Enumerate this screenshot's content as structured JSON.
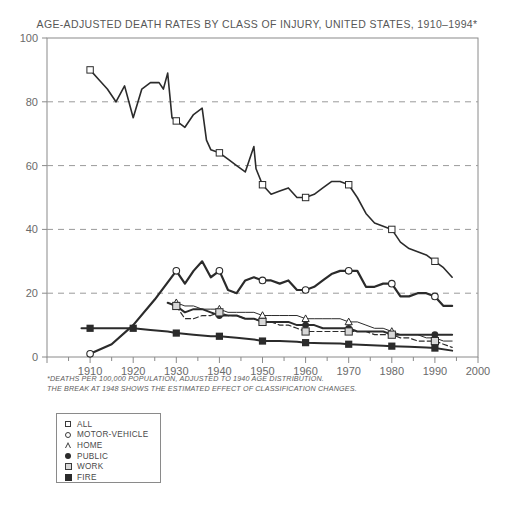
{
  "chart_data": {
    "type": "line",
    "title": "AGE-ADJUSTED DEATH RATES BY CLASS OF INJURY, UNITED STATES, 1910–1994*",
    "xlabel": "",
    "ylabel": "",
    "xlim": [
      1900,
      2000
    ],
    "ylim": [
      0,
      100
    ],
    "xticks": [
      1900,
      1910,
      1920,
      1930,
      1940,
      1950,
      1960,
      1970,
      1980,
      1990,
      2000
    ],
    "xtick_labels": [
      "",
      "1910",
      "1920",
      "1930",
      "1940",
      "1950",
      "1960",
      "1970",
      "1980",
      "1990",
      "2000"
    ],
    "yticks": [
      0,
      20,
      40,
      60,
      80,
      100
    ],
    "ytick_labels": [
      "0",
      "20",
      "40",
      "60",
      "80",
      "100"
    ],
    "grid": "horizontal dashed at 20,40,60,80",
    "legend_position": "below-left",
    "minor_xtick_interval": 5,
    "footnote_line1": "*DEATHS PER 100,000 POPULATION, ADJUSTED TO 1940 AGE DISTRIBUTION.",
    "footnote_line2": "THE BREAK AT 1948 SHOWS THE ESTIMATED EFFECT OF CLASSIFICATION CHANGES.",
    "series": [
      {
        "name": "ALL",
        "marker": "square-open",
        "marker_years": [
          1910,
          1930,
          1940,
          1950,
          1960,
          1970,
          1980,
          1990
        ],
        "linewidth": 1.6,
        "x": [
          1910,
          1912,
          1914,
          1916,
          1918,
          1920,
          1922,
          1924,
          1926,
          1927,
          1928,
          1929,
          1930,
          1932,
          1934,
          1936,
          1937,
          1938,
          1940,
          1942,
          1944,
          1946,
          1948,
          1948.5,
          1950,
          1952,
          1954,
          1956,
          1958,
          1960,
          1962,
          1964,
          1966,
          1968,
          1970,
          1972,
          1974,
          1976,
          1978,
          1980,
          1982,
          1984,
          1986,
          1988,
          1990,
          1992,
          1994
        ],
        "y": [
          90,
          87,
          84,
          80,
          85,
          75,
          84,
          86,
          86,
          84,
          89,
          75,
          74,
          72,
          76,
          78,
          68,
          65,
          64,
          62,
          60,
          58,
          66,
          59,
          54,
          51,
          52,
          53,
          50,
          50,
          51,
          53,
          55,
          55,
          54,
          50,
          45,
          42,
          41,
          40,
          36,
          34,
          33,
          32,
          30,
          28,
          25
        ]
      },
      {
        "name": "MOTOR-VEHICLE",
        "marker": "circle-open",
        "marker_years": [
          1910,
          1930,
          1940,
          1950,
          1960,
          1970,
          1980,
          1990
        ],
        "linewidth": 2.2,
        "x": [
          1910,
          1915,
          1920,
          1925,
          1930,
          1932,
          1934,
          1936,
          1938,
          1940,
          1942,
          1944,
          1946,
          1948,
          1950,
          1952,
          1954,
          1956,
          1958,
          1960,
          1962,
          1964,
          1966,
          1968,
          1970,
          1972,
          1974,
          1976,
          1978,
          1980,
          1982,
          1984,
          1986,
          1988,
          1990,
          1992,
          1994
        ],
        "y": [
          1,
          4,
          10,
          18,
          27,
          23,
          27,
          30,
          25,
          27,
          21,
          20,
          24,
          25,
          24,
          24,
          23,
          24,
          21,
          21,
          22,
          24,
          26,
          27,
          27,
          27,
          22,
          22,
          23,
          23,
          19,
          19,
          20,
          20,
          19,
          16,
          16
        ]
      },
      {
        "name": "HOME",
        "marker": "triangle-open",
        "marker_years": [
          1930,
          1940,
          1950,
          1960,
          1970,
          1980,
          1990
        ],
        "linewidth": 1.0,
        "x": [
          1930,
          1932,
          1934,
          1936,
          1938,
          1940,
          1942,
          1944,
          1946,
          1948,
          1950,
          1952,
          1954,
          1956,
          1958,
          1960,
          1962,
          1964,
          1966,
          1968,
          1970,
          1972,
          1974,
          1976,
          1978,
          1980,
          1982,
          1984,
          1986,
          1988,
          1990,
          1992,
          1994
        ],
        "y": [
          17,
          16,
          16,
          15,
          15,
          15,
          14,
          14,
          14,
          14,
          13,
          13,
          13,
          13,
          13,
          12,
          12,
          12,
          12,
          12,
          11,
          11,
          10,
          9,
          9,
          8,
          7,
          7,
          7,
          6,
          6,
          5,
          5
        ]
      },
      {
        "name": "PUBLIC",
        "marker": "circle-filled",
        "marker_years": [
          1930,
          1940,
          1950,
          1960,
          1970,
          1980,
          1990
        ],
        "linewidth": 2.0,
        "x": [
          1928,
          1930,
          1932,
          1934,
          1936,
          1938,
          1940,
          1942,
          1944,
          1946,
          1948,
          1950,
          1952,
          1954,
          1956,
          1958,
          1960,
          1962,
          1964,
          1966,
          1968,
          1970,
          1972,
          1974,
          1976,
          1978,
          1980,
          1982,
          1984,
          1986,
          1988,
          1990,
          1992,
          1994
        ],
        "y": [
          17,
          16,
          14,
          15,
          15,
          14,
          13,
          13,
          13,
          12,
          12,
          11,
          11,
          11,
          11,
          10,
          10,
          10,
          9,
          9,
          9,
          9,
          8,
          8,
          8,
          8,
          7,
          7,
          7,
          7,
          7,
          7,
          7,
          7
        ]
      },
      {
        "name": "WORK",
        "marker": "square-grey",
        "marker_years": [
          1930,
          1940,
          1950,
          1960,
          1970,
          1980,
          1990
        ],
        "linewidth": 1.2,
        "linestyle": "dashed",
        "x": [
          1930,
          1932,
          1934,
          1936,
          1938,
          1940,
          1942,
          1944,
          1946,
          1948,
          1950,
          1952,
          1954,
          1956,
          1958,
          1960,
          1962,
          1964,
          1966,
          1968,
          1970,
          1972,
          1974,
          1976,
          1978,
          1980,
          1982,
          1984,
          1986,
          1988,
          1990,
          1992,
          1994
        ],
        "y": [
          16,
          12,
          12,
          13,
          13,
          14,
          13,
          13,
          12,
          12,
          11,
          11,
          10,
          10,
          9,
          8,
          8,
          8,
          8,
          8,
          8,
          8,
          8,
          7,
          7,
          7,
          6,
          6,
          5,
          5,
          5,
          4,
          3
        ]
      },
      {
        "name": "FIRE",
        "marker": "square-filled",
        "marker_years": [
          1910,
          1920,
          1930,
          1940,
          1950,
          1960,
          1970,
          1980,
          1990
        ],
        "linewidth": 2.0,
        "x": [
          1908,
          1910,
          1914,
          1918,
          1920,
          1924,
          1928,
          1930,
          1934,
          1938,
          1940,
          1944,
          1948,
          1950,
          1954,
          1958,
          1960,
          1964,
          1968,
          1970,
          1974,
          1978,
          1980,
          1984,
          1988,
          1990,
          1994
        ],
        "y": [
          9,
          9,
          9,
          9,
          9,
          8.5,
          8,
          7.5,
          7,
          6.5,
          6.5,
          6,
          5.5,
          5,
          5,
          4.8,
          4.5,
          4.3,
          4.2,
          4,
          3.8,
          3.5,
          3.4,
          3.2,
          3,
          2.8,
          2
        ]
      }
    ]
  },
  "legend": {
    "items": [
      {
        "label": "ALL",
        "marker": "square-open"
      },
      {
        "label": "MOTOR-VEHICLE",
        "marker": "circle-open"
      },
      {
        "label": "HOME",
        "marker": "triangle-open"
      },
      {
        "label": "PUBLIC",
        "marker": "circle-filled"
      },
      {
        "label": "WORK",
        "marker": "square-grey"
      },
      {
        "label": "FIRE",
        "marker": "square-filled"
      }
    ]
  },
  "colors": {
    "line": "#2b2b2b",
    "grid": "#9a9a9a",
    "axis": "#8a8a8a",
    "text": "#5d5d5d",
    "work_fill": "#d8d8d8"
  }
}
